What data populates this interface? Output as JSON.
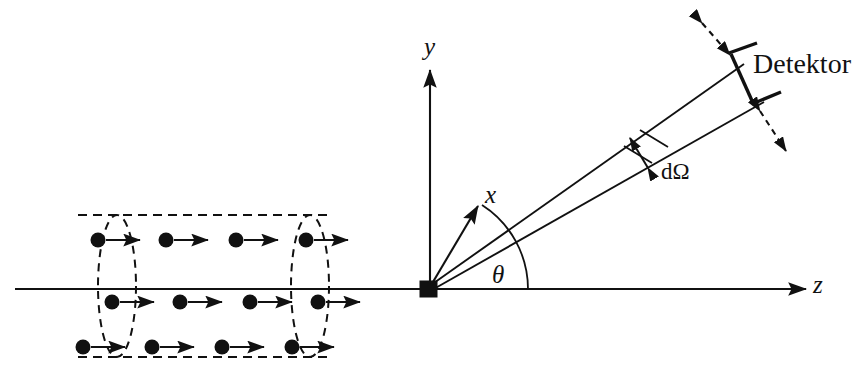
{
  "figure": {
    "background_color": "#ffffff",
    "ink_color": "#111111",
    "width": 866,
    "height": 376
  },
  "axes": {
    "y_label": "y",
    "x_label": "x",
    "z_label": "z",
    "angle_label": "θ"
  },
  "annotations": {
    "solid_angle_label": "dΩ",
    "detector_label": "Detektor"
  },
  "beam": {
    "particle_rows": [
      {
        "y": 240,
        "particles_x": [
          98,
          166,
          236,
          306
        ]
      },
      {
        "y": 302,
        "particles_x": [
          112,
          180,
          250,
          318
        ]
      },
      {
        "y": 347,
        "particles_x": [
          83,
          152,
          222,
          292
        ]
      }
    ],
    "cylinder": {
      "left_ellipse_cx": 117,
      "right_ellipse_cx": 310,
      "ellipse_rx": 18,
      "ellipse_cy": 286,
      "ellipse_ry": 70,
      "top_y": 215,
      "bottom_y": 357,
      "body_left_x": 78,
      "body_right_x": 330
    },
    "arrow_length": 38,
    "dot_radius": 7
  },
  "geometry": {
    "origin": {
      "x": 428,
      "y": 289
    },
    "target_square_size": 17,
    "z_axis": {
      "x1": 15,
      "x2": 806
    },
    "y_axis": {
      "y_top": 70
    },
    "x_axis_tip": {
      "x": 478,
      "y": 204
    },
    "cone_upper": {
      "x": 742,
      "y": 66
    },
    "cone_lower": {
      "x": 762,
      "y": 104
    },
    "theta_arc_radius": 88,
    "detector_bracket": {
      "upper_bar_outer": {
        "x": 755,
        "y": 45
      },
      "lower_bar_outer": {
        "x": 779,
        "y": 93
      }
    },
    "motion_arrow_upper": {
      "x1": 701,
      "y1": 22,
      "x2": 731,
      "y2": 56
    },
    "motion_arrow_lower": {
      "x1": 759,
      "y1": 110,
      "x2": 786,
      "y2": 152
    }
  }
}
